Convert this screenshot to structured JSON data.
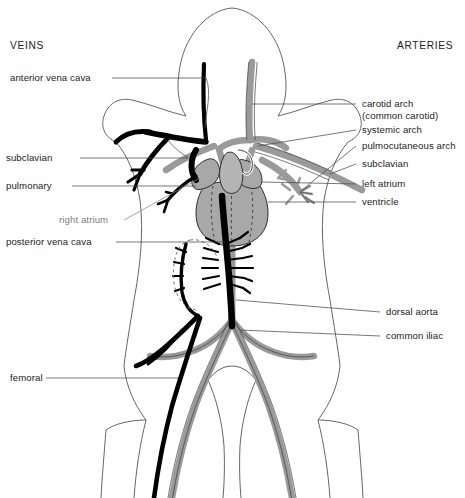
{
  "diagram": {
    "title_left": "VEINS",
    "title_right": "ARTERIES",
    "colors": {
      "vein": "#000000",
      "artery": "#9a9a9a",
      "artery_outline": "#3a3a3a",
      "body_outline": "#555555",
      "leader_line": "#4a4a4a",
      "gray_text": "#7d7d7d",
      "text": "#222222",
      "background": "#ffffff"
    }
  },
  "labels_left": [
    {
      "id": "veins-heading",
      "text": "VEINS"
    },
    {
      "id": "anterior-vena-cava",
      "text": "anterior vena cava"
    },
    {
      "id": "subclavian-vein",
      "text": "subclavian"
    },
    {
      "id": "pulmonary-vein",
      "text": "pulmonary"
    },
    {
      "id": "right-atrium",
      "text": "right atrium"
    },
    {
      "id": "posterior-vena-cava",
      "text": "posterior vena cava"
    },
    {
      "id": "femoral-vein",
      "text": "femoral"
    }
  ],
  "labels_right": [
    {
      "id": "arteries-heading",
      "text": "ARTERIES"
    },
    {
      "id": "carotid-arch",
      "text": "carotid arch"
    },
    {
      "id": "carotid-arch-alt",
      "text": "(common carotid)"
    },
    {
      "id": "systemic-arch",
      "text": "systemic arch"
    },
    {
      "id": "pulmocutaneous-arch",
      "text": "pulmocutaneous arch"
    },
    {
      "id": "subclavian-artery",
      "text": "subclavian"
    },
    {
      "id": "left-atrium",
      "text": "left atrium"
    },
    {
      "id": "ventricle",
      "text": "ventricle"
    },
    {
      "id": "dorsal-aorta",
      "text": "dorsal aorta"
    },
    {
      "id": "common-iliac",
      "text": "common iliac"
    }
  ]
}
